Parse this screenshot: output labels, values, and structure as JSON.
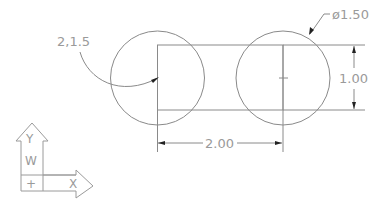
{
  "drawing": {
    "colors": {
      "geometry": "#8a8a8a",
      "text": "#9a9a9a",
      "arrowhead": "#222222",
      "background": "#ffffff"
    },
    "left_circle": {
      "label": "left-circle"
    },
    "right_circle": {
      "label": "right-circle"
    },
    "coordinate_label": "2,1.5",
    "diameter_label": "ø1.50",
    "height_dimension": "1.00",
    "width_dimension": "2.00"
  },
  "ucs_icon": {
    "y_axis_label": "Y",
    "world_label": "W",
    "x_axis_label": "X",
    "origin_symbol": "+"
  }
}
